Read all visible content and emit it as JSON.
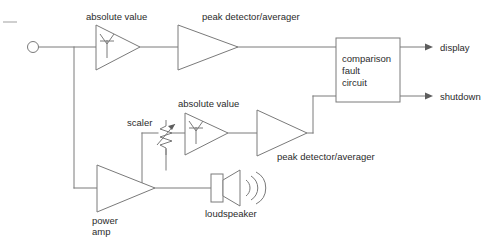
{
  "diagram": {
    "line_color": "#7a7a7a",
    "text_color": "#2b2b2b",
    "background": "#ffffff",
    "blocks": {
      "input_terminal": {
        "name": "input terminal",
        "label": ""
      },
      "abs_value_top": {
        "label": "absolute value"
      },
      "peak_detector_top": {
        "label": "peak detector/averager"
      },
      "comparison_circuit": {
        "line1": "comparison",
        "line2": "fault",
        "line3": "circuit"
      },
      "scaler": {
        "label": "scaler"
      },
      "abs_value_bottom": {
        "label": "absolute value"
      },
      "peak_detector_bottom": {
        "label": "peak detector/averager"
      },
      "power_amp": {
        "line1": "power",
        "line2": "amp"
      },
      "loudspeaker": {
        "label": "loudspeaker"
      }
    },
    "outputs": [
      {
        "label": "display"
      },
      {
        "label": "shutdown"
      }
    ]
  }
}
